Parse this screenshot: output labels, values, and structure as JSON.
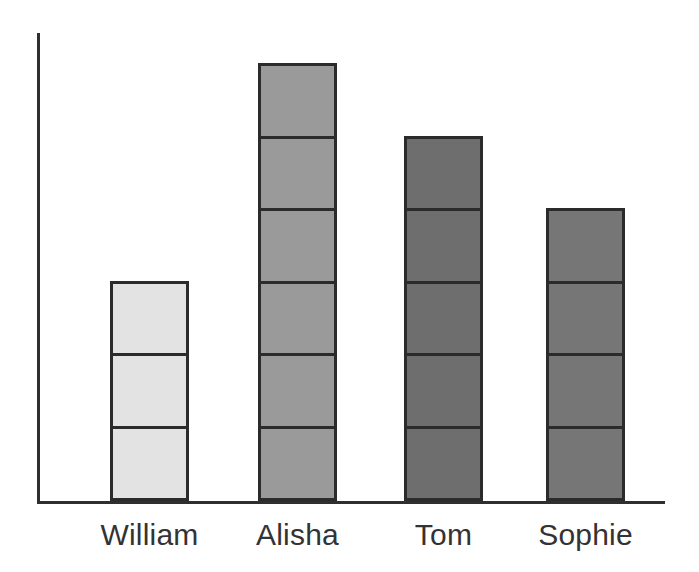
{
  "chart_data": {
    "type": "bar",
    "title": "",
    "subtitle": "",
    "xlabel": "",
    "ylabel": "",
    "categories": [
      "William",
      "Alisha",
      "Tom",
      "Sophie"
    ],
    "values": [
      3,
      6,
      5,
      4
    ],
    "unit": "segments",
    "ylim": [
      0,
      6
    ],
    "grid": false,
    "legend": null,
    "tick_labels_x": [
      "William",
      "Alisha",
      "Tom",
      "Sophie"
    ],
    "tick_labels_y": [],
    "annotations": [],
    "series": [
      {
        "name": "count",
        "values": [
          3,
          6,
          5,
          4
        ]
      }
    ],
    "bars": [
      {
        "category": "William",
        "segments": 3,
        "fill": "#e3e3e3",
        "border": "#2b2b2b"
      },
      {
        "category": "Alisha",
        "segments": 6,
        "fill": "#9a9a9a",
        "border": "#2b2b2b"
      },
      {
        "category": "Tom",
        "segments": 5,
        "fill": "#6e6e6e",
        "border": "#2b2b2b"
      },
      {
        "category": "Sophie",
        "segments": 4,
        "fill": "#767676",
        "border": "#2b2b2b"
      }
    ],
    "style": {
      "background": "#ffffff",
      "axis_color": "#2f2f2f",
      "label_color": "#333333"
    },
    "layout": {
      "bar_width": 79,
      "segment_height": 75.5,
      "baseline_y": 501,
      "axis_y_x": 37,
      "axis_y_top": 33,
      "axis_x_right": 665,
      "bar_x": [
        110,
        258,
        404,
        546
      ],
      "label_y": 516
    }
  }
}
